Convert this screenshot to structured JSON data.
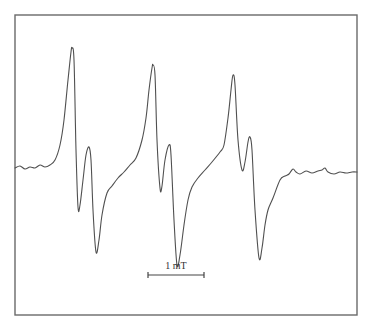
{
  "chart_data": {
    "type": "line",
    "title": "",
    "xlabel": "",
    "ylabel": "",
    "grid": false,
    "legend": null,
    "scale_bar": {
      "label": "1 mT",
      "x1": 148,
      "x2": 204,
      "y": 275
    },
    "frame": {
      "x": 15,
      "y": 15,
      "width": 342,
      "height": 300
    },
    "points": [
      [
        15,
        168
      ],
      [
        20,
        166
      ],
      [
        25,
        169
      ],
      [
        30,
        167
      ],
      [
        35,
        168
      ],
      [
        40,
        165
      ],
      [
        45,
        167
      ],
      [
        50,
        165
      ],
      [
        55,
        160
      ],
      [
        60,
        145
      ],
      [
        64,
        120
      ],
      [
        68,
        80
      ],
      [
        71,
        52
      ],
      [
        72,
        48
      ],
      [
        74,
        60
      ],
      [
        76,
        150
      ],
      [
        78,
        207
      ],
      [
        80,
        205
      ],
      [
        83,
        180
      ],
      [
        86,
        155
      ],
      [
        89,
        147
      ],
      [
        91,
        160
      ],
      [
        93,
        210
      ],
      [
        96,
        252
      ],
      [
        99,
        240
      ],
      [
        102,
        215
      ],
      [
        107,
        193
      ],
      [
        112,
        186
      ],
      [
        118,
        178
      ],
      [
        124,
        172
      ],
      [
        130,
        165
      ],
      [
        136,
        158
      ],
      [
        142,
        140
      ],
      [
        146,
        118
      ],
      [
        149,
        90
      ],
      [
        152,
        68
      ],
      [
        153,
        65
      ],
      [
        155,
        75
      ],
      [
        157,
        140
      ],
      [
        160,
        188
      ],
      [
        162,
        186
      ],
      [
        165,
        160
      ],
      [
        169,
        145
      ],
      [
        171,
        155
      ],
      [
        174,
        220
      ],
      [
        177,
        265
      ],
      [
        180,
        255
      ],
      [
        184,
        225
      ],
      [
        188,
        200
      ],
      [
        192,
        187
      ],
      [
        198,
        178
      ],
      [
        205,
        170
      ],
      [
        212,
        162
      ],
      [
        220,
        152
      ],
      [
        224,
        145
      ],
      [
        228,
        118
      ],
      [
        231,
        90
      ],
      [
        233,
        75
      ],
      [
        235,
        85
      ],
      [
        238,
        140
      ],
      [
        242,
        170
      ],
      [
        245,
        162
      ],
      [
        248,
        142
      ],
      [
        250,
        137
      ],
      [
        252,
        150
      ],
      [
        255,
        210
      ],
      [
        259,
        258
      ],
      [
        262,
        248
      ],
      [
        265,
        225
      ],
      [
        268,
        210
      ],
      [
        273,
        198
      ],
      [
        280,
        180
      ],
      [
        285,
        176
      ],
      [
        289,
        174
      ],
      [
        293,
        169
      ],
      [
        296,
        172
      ],
      [
        300,
        174
      ],
      [
        306,
        171
      ],
      [
        312,
        173
      ],
      [
        318,
        171
      ],
      [
        322,
        170
      ],
      [
        325,
        168
      ],
      [
        328,
        172
      ],
      [
        334,
        174
      ],
      [
        340,
        172
      ],
      [
        346,
        173
      ],
      [
        352,
        172
      ],
      [
        357,
        172
      ]
    ],
    "features": [
      {
        "name": "group-1",
        "peak_x": 72,
        "peak_y": 48,
        "dip_x": 78,
        "dip_y": 207,
        "peak2_x": 89,
        "peak2_y": 147,
        "min_x": 96,
        "min_y": 252
      },
      {
        "name": "group-2",
        "peak_x": 153,
        "peak_y": 65,
        "dip_x": 160,
        "dip_y": 188,
        "peak2_x": 169,
        "peak2_y": 145,
        "min_x": 177,
        "min_y": 265
      },
      {
        "name": "group-3",
        "peak_x": 233,
        "peak_y": 75,
        "dip_x": 242,
        "dip_y": 170,
        "peak2_x": 250,
        "peak2_y": 137,
        "min_x": 259,
        "min_y": 258
      }
    ]
  }
}
